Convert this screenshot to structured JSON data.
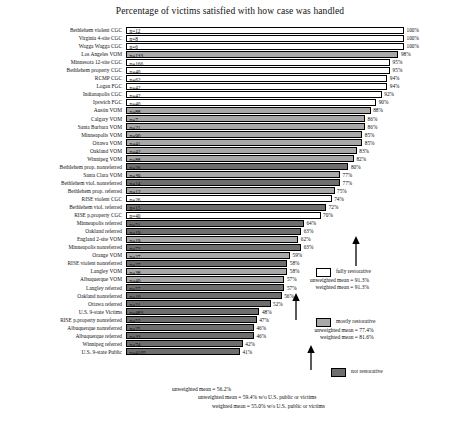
{
  "chart": {
    "title": "Percentage of victims satisfied with how case was handled"
  },
  "colors": {
    "fully_restorative": "#ffffff",
    "mostly_restorative": "#a8a8a8",
    "not_restorative": "#6e6e6e",
    "outline": "#000000"
  },
  "legend": {
    "fully": {
      "label": "fully restorative",
      "unweighted": "unweighted mean = 91.3%",
      "weighted": "weighted mean = 91.3%"
    },
    "mostly": {
      "label": "mostly restorative",
      "unweighted": "unweighted mean = 77.4%",
      "weighted": "weighted mean = 81.6%"
    },
    "not": {
      "label": "not restorative",
      "unweighted": "unweighted mean = 56.2%",
      "unweighted_excl": "unweighted mean = 59.4% w/o U.S. public or victims",
      "weighted_excl": "weighted mean = 55.0% w/o U.S. public or victims"
    }
  },
  "chart_data": {
    "type": "bar",
    "orientation": "horizontal",
    "title": "Percentage of victims satisfied with how case was handled",
    "xlabel": "",
    "ylabel": "",
    "xlim": [
      0,
      100
    ],
    "grid": false,
    "legend_position": "right",
    "value_unit": "percent",
    "categories": [
      "Bethlehem violent CGC",
      "Virginia 4-site CGC",
      "Wagga Wagga CGC",
      "Los Angeles VOM",
      "Minnesota 12-site CGC",
      "Bethlehem property CGC",
      "RCMP CGC",
      "Logan FGC",
      "Indianapolis CGC",
      "Ipswich FGC",
      "Austin VOM",
      "Calgary VOM",
      "Santa Barbara VOM",
      "Minneapolis VOM",
      "Ottawa VOM",
      "Oakland VOM",
      "Winnipeg VOM",
      "Bethlehem prop. nonreferred",
      "Santa Clara VOM",
      "Bethlehem viol. nonreferred",
      "Bethlehem prop. referred",
      "RISE violent CGC",
      "Bethlehem viol. referred",
      "RISE p.property CGC",
      "Minneapolis referred",
      "Oakland referred",
      "England 2-site VOM",
      "Minneapolis nonreferred",
      "Orange VOM",
      "RISE violent nonreferred",
      "Langley VOM",
      "Albuquerque VOM",
      "Langley referred",
      "Oakland nonreferred",
      "Ottawa referred",
      "U.S. 9-state Victims",
      "RISE p.property nonreferred",
      "Albuquerque nonreferred",
      "Albuquerque referred",
      "Winnipeg referred",
      "U.S. 9-state Public"
    ],
    "values": [
      100,
      100,
      100,
      98,
      95,
      95,
      94,
      94,
      92,
      90,
      88,
      86,
      86,
      85,
      85,
      83,
      82,
      80,
      77,
      77,
      75,
      74,
      72,
      70,
      64,
      63,
      62,
      63,
      59,
      58,
      58,
      57,
      57,
      56,
      52,
      48,
      47,
      46,
      46,
      42,
      41
    ],
    "n_labels": [
      "n=12",
      "n=8",
      "n=6",
      "n=133",
      "n=166",
      "n=40",
      "n=62",
      "n=42",
      "n=42",
      "n=40",
      "n=88",
      "n=7",
      "n=21",
      "n=90",
      "n=41",
      "n=42",
      "n=88",
      "n=26",
      "n=39",
      "n=14",
      "n=12",
      "n=26",
      "n=15",
      "n=40",
      "n=51",
      "n=19",
      "n=19",
      "n=72",
      "n=27",
      "n=27",
      "n=38",
      "n=40",
      "n=57",
      "n=10",
      "n=21",
      "n=483",
      "n=52",
      "n=25",
      "n=33",
      "n=74",
      "n=4105"
    ],
    "pct_labels": [
      "100%",
      "100%",
      "100%",
      "98%",
      "95%",
      "95%",
      "94%",
      "94%",
      "92%",
      "90%",
      "88%",
      "86%",
      "86%",
      "85%",
      "85%",
      "83%",
      "82%",
      "80%",
      "77%",
      "77%",
      "75%",
      "74%",
      "72%",
      "70%",
      "64%",
      "63%",
      "62%",
      "63%",
      "59%",
      "58%",
      "58%",
      "57%",
      "57%",
      "56%",
      "52%",
      "48%",
      "47%",
      "46%",
      "46%",
      "42%",
      "41%"
    ],
    "groups": [
      "fully",
      "fully",
      "fully",
      "mostly",
      "fully",
      "fully",
      "fully",
      "fully",
      "fully",
      "fully",
      "mostly",
      "mostly",
      "mostly",
      "mostly",
      "mostly",
      "mostly",
      "mostly",
      "not",
      "mostly",
      "not",
      "mostly",
      "fully",
      "not",
      "fully",
      "not",
      "not",
      "mostly",
      "not",
      "mostly",
      "not",
      "mostly",
      "mostly",
      "not",
      "not",
      "not",
      "not",
      "not",
      "not",
      "not",
      "not",
      "not"
    ],
    "series_groups": [
      {
        "name": "fully restorative",
        "color": "#ffffff",
        "unweighted_mean": 91.3,
        "weighted_mean": 91.3
      },
      {
        "name": "mostly restorative",
        "color": "#a8a8a8",
        "unweighted_mean": 77.4,
        "weighted_mean": 81.6
      },
      {
        "name": "not restorative",
        "color": "#6e6e6e",
        "unweighted_mean": 56.2,
        "unweighted_mean_excl": 59.4,
        "weighted_mean_excl": 55.0
      }
    ]
  }
}
